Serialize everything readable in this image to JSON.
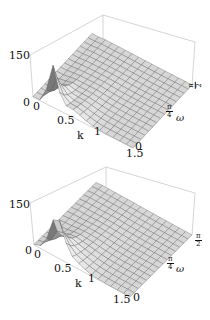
{
  "chart_data": [
    {
      "type": "surface3d",
      "title": "",
      "xlabel": "k",
      "ylabel": "ω",
      "zlabel": "",
      "xlim": [
        0,
        1.5
      ],
      "ylim": [
        0,
        1.5708
      ],
      "zlim": [
        0,
        150
      ],
      "x_ticks": [
        "0",
        "0.5",
        "1",
        "1.5"
      ],
      "y_ticks": [
        "0",
        "π/4",
        "π/2"
      ],
      "z_ticks": [
        "0",
        "150"
      ],
      "peak": {
        "k": 0.3,
        "omega": 0.0,
        "z": 150
      },
      "description": "Sharp peak near k≈0.3 at low ω, decaying to near-zero plateau for k>1 across all ω",
      "box": {
        "back_top": [
          103,
          15
        ],
        "right_top": [
          195,
          42
        ],
        "left_top": [
          30,
          55
        ],
        "left_bottom": [
          33,
          97
        ],
        "front_bottom": [
          133,
          148
        ],
        "right_bottom": [
          192,
          85
        ]
      },
      "grid": {
        "nk": 15,
        "nw": 15
      }
    },
    {
      "type": "surface3d",
      "title": "",
      "xlabel": "k",
      "ylabel": "ω",
      "zlabel": "",
      "xlim": [
        0,
        1.5
      ],
      "ylim": [
        0,
        1.5708
      ],
      "zlim": [
        0,
        150
      ],
      "x_ticks": [
        "0",
        "0.5",
        "1",
        "1.5"
      ],
      "y_ticks": [
        "0",
        "π/4",
        "π/2"
      ],
      "z_ticks": [
        "0",
        "150"
      ],
      "peak": {
        "k": 0.35,
        "omega": 0.05,
        "z": 130
      },
      "description": "Slightly broader and lower peak near k≈0.35, decaying to near-zero plateau for k>1",
      "box": {
        "back_top": [
          106,
          7
        ],
        "right_top": [
          195,
          33
        ],
        "left_top": [
          30,
          43
        ],
        "left_bottom": [
          34,
          85
        ],
        "front_bottom": [
          130,
          137
        ],
        "right_bottom": [
          192,
          75
        ]
      },
      "grid": {
        "nk": 15,
        "nw": 15
      }
    }
  ],
  "plots": [
    {
      "z_tick_top": "150",
      "z_tick_bottom": "0",
      "k_tick_0": "0",
      "k_tick_05": "0.5",
      "k_tick_1": "1",
      "k_tick_15": "1.5",
      "k_label": "k",
      "w_tick_0": "0",
      "w_tick_pi4_num": "π",
      "w_tick_pi4_den": "4",
      "w_tick_pi2_num": "π",
      "w_tick_pi2_den": "2",
      "w_label": "ω"
    },
    {
      "z_tick_top": "150",
      "z_tick_bottom": "0",
      "k_tick_0": "0",
      "k_tick_05": "0.5",
      "k_tick_1": "1",
      "k_tick_15": "1.5",
      "k_label": "k",
      "w_tick_0": "0",
      "w_tick_pi4_num": "π",
      "w_tick_pi4_den": "4",
      "w_tick_pi2_num": "π",
      "w_tick_pi2_den": "2",
      "w_label": "ω"
    }
  ],
  "colors": {
    "box": "#b8b8b8",
    "mesh": "#555555",
    "surface_light": "#e6e6e6",
    "surface_dark": "#8a8a8a"
  }
}
